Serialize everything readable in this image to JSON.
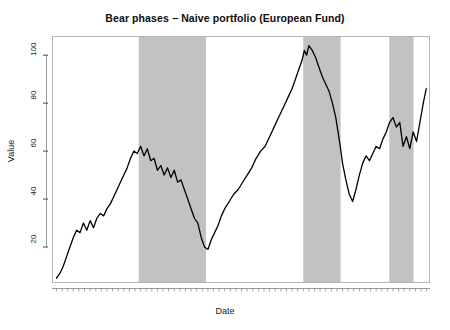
{
  "chart_data": {
    "type": "line",
    "title": "Bear phases − Naive portfolio (European Fund)",
    "xlabel": "Date",
    "ylabel": "Value",
    "grid": false,
    "legend": null,
    "xlim": [
      "Jan 1996",
      "Dez 2012"
    ],
    "ylim": [
      5,
      108
    ],
    "y_ticks": [
      20,
      40,
      60,
      80,
      100
    ],
    "x_ticks": [
      "Jan 97",
      "Jan 99",
      "Jan 01",
      "Jan 03",
      "Jan 05",
      "Jan 07",
      "Jan 09",
      "Jan 11",
      "Dez 12"
    ],
    "shaded_regions_label": "Bear phases",
    "shaded_regions": [
      {
        "start": "Mar 2000",
        "end": "Mar 2003"
      },
      {
        "start": "Jul 2007",
        "end": "Mar 2009"
      },
      {
        "start": "May 2011",
        "end": "Jun 2012"
      }
    ],
    "series": [
      {
        "name": "Naive portfolio (European Fund)",
        "color": "#000000",
        "x": [
          1996.5,
          1996.65,
          1996.8,
          1996.95,
          1997.1,
          1997.25,
          1997.4,
          1997.55,
          1997.7,
          1997.85,
          1998.0,
          1998.15,
          1998.3,
          1998.45,
          1998.6,
          1998.75,
          1998.9,
          1999.05,
          1999.2,
          1999.35,
          1999.5,
          1999.65,
          1999.8,
          1999.95,
          2000.1,
          2000.25,
          2000.4,
          2000.55,
          2000.7,
          2000.85,
          2001.0,
          2001.15,
          2001.3,
          2001.45,
          2001.6,
          2001.75,
          2001.9,
          2002.05,
          2002.2,
          2002.35,
          2002.5,
          2002.65,
          2002.8,
          2002.95,
          2003.1,
          2003.25,
          2003.4,
          2003.55,
          2003.7,
          2003.85,
          2004.0,
          2004.2,
          2004.4,
          2004.6,
          2004.8,
          2005.0,
          2005.2,
          2005.4,
          2005.6,
          2005.8,
          2006.0,
          2006.2,
          2006.4,
          2006.6,
          2006.8,
          2007.0,
          2007.15,
          2007.3,
          2007.45,
          2007.55,
          2007.65,
          2007.75,
          2007.9,
          2008.05,
          2008.2,
          2008.35,
          2008.5,
          2008.65,
          2008.8,
          2008.95,
          2009.05,
          2009.15,
          2009.25,
          2009.4,
          2009.55,
          2009.7,
          2009.85,
          2010.0,
          2010.15,
          2010.3,
          2010.45,
          2010.6,
          2010.75,
          2010.9,
          2011.05,
          2011.2,
          2011.35,
          2011.5,
          2011.65,
          2011.8,
          2011.95,
          2012.1,
          2012.25,
          2012.4,
          2012.55,
          2012.7,
          2012.85,
          2012.98
        ],
        "y": [
          7,
          9,
          12,
          16,
          20,
          24,
          27,
          26,
          30,
          27,
          31,
          28,
          32,
          34,
          33,
          36,
          38,
          41,
          44,
          47,
          50,
          53,
          57,
          60,
          59,
          62,
          58,
          61,
          56,
          57,
          52,
          54,
          50,
          53,
          49,
          52,
          47,
          48,
          44,
          40,
          36,
          32,
          30,
          24,
          20,
          19,
          23,
          26,
          29,
          33,
          36,
          39,
          42,
          44,
          47,
          50,
          53,
          57,
          60,
          62,
          66,
          70,
          74,
          78,
          82,
          86,
          90,
          94,
          98,
          102,
          100,
          104,
          102,
          99,
          95,
          91,
          88,
          85,
          80,
          74,
          68,
          62,
          55,
          48,
          42,
          39,
          44,
          50,
          55,
          58,
          56,
          59,
          62,
          61,
          65,
          68,
          72,
          74,
          70,
          72,
          62,
          66,
          61,
          68,
          64,
          72,
          80,
          86
        ]
      }
    ]
  },
  "axes": {
    "y_tick_labels": [
      "20",
      "40",
      "60",
      "80",
      "100"
    ],
    "x_tick_labels": [
      "Jan 97",
      "Jan 99",
      "Jan 01",
      "Jan 03",
      "Jan 05",
      "Jan 07",
      "Jan 09",
      "Jan 11",
      "Dez 12"
    ]
  },
  "colors": {
    "line": "#000000",
    "band": "#c2c2c2",
    "frame": "#b5b5b5",
    "text": "#1a1a1a"
  }
}
